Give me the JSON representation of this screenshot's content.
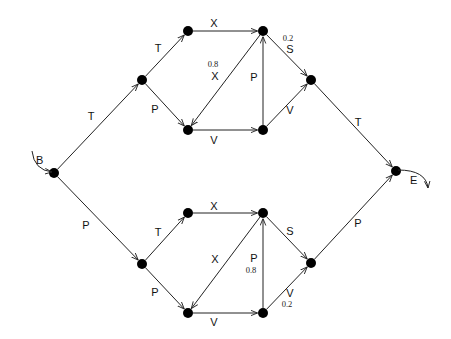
{
  "diagram": {
    "start_label": "B",
    "end_label": "E",
    "colors": {
      "line": "#222222",
      "node": "#000000",
      "background": "#ffffff"
    },
    "nodes": [
      {
        "id": "B",
        "x": 54,
        "y": 173
      },
      {
        "id": "u1",
        "x": 142,
        "y": 80
      },
      {
        "id": "u2",
        "x": 188,
        "y": 31
      },
      {
        "id": "u3",
        "x": 188,
        "y": 130
      },
      {
        "id": "u4",
        "x": 263,
        "y": 31
      },
      {
        "id": "u5",
        "x": 263,
        "y": 130
      },
      {
        "id": "u6",
        "x": 311,
        "y": 80
      },
      {
        "id": "l1",
        "x": 142,
        "y": 264
      },
      {
        "id": "l2",
        "x": 188,
        "y": 213
      },
      {
        "id": "l3",
        "x": 188,
        "y": 313
      },
      {
        "id": "l4",
        "x": 263,
        "y": 213
      },
      {
        "id": "l5",
        "x": 263,
        "y": 313
      },
      {
        "id": "l6",
        "x": 311,
        "y": 263
      },
      {
        "id": "E",
        "x": 396,
        "y": 171
      }
    ],
    "edges": [
      {
        "from": "B",
        "to": "u1",
        "label": "T",
        "lx": 91,
        "ly": 120
      },
      {
        "from": "B",
        "to": "l1",
        "label": "P",
        "lx": 86,
        "ly": 229
      },
      {
        "from": "u1",
        "to": "u2",
        "label": "T",
        "lx": 158,
        "ly": 52
      },
      {
        "from": "u1",
        "to": "u3",
        "label": "P",
        "lx": 155,
        "ly": 113
      },
      {
        "from": "u2",
        "to": "u4",
        "label": "X",
        "lx": 214,
        "ly": 27
      },
      {
        "from": "u3",
        "to": "u5",
        "label": "V",
        "lx": 214,
        "ly": 144
      },
      {
        "from": "u5",
        "to": "u4",
        "label": "P",
        "lx": 254,
        "ly": 81
      },
      {
        "from": "u4",
        "to": "u3",
        "label": "X",
        "lx": 215,
        "ly": 80,
        "prob": "0.8",
        "px": 213,
        "py": 67
      },
      {
        "from": "u4",
        "to": "u6",
        "label": "S",
        "lx": 290,
        "ly": 53,
        "prob": "0.2",
        "px": 288,
        "py": 41
      },
      {
        "from": "u5",
        "to": "u6",
        "label": "V",
        "lx": 290,
        "ly": 114
      },
      {
        "from": "u6",
        "to": "E",
        "label": "T",
        "lx": 358,
        "ly": 126
      },
      {
        "from": "l1",
        "to": "l2",
        "label": "T",
        "lx": 158,
        "ly": 236
      },
      {
        "from": "l1",
        "to": "l3",
        "label": "P",
        "lx": 155,
        "ly": 296
      },
      {
        "from": "l2",
        "to": "l4",
        "label": "X",
        "lx": 214,
        "ly": 210
      },
      {
        "from": "l3",
        "to": "l5",
        "label": "V",
        "lx": 214,
        "ly": 326
      },
      {
        "from": "l5",
        "to": "l4",
        "label": "P",
        "lx": 254,
        "ly": 262,
        "prob": "0.8",
        "px": 251,
        "py": 273
      },
      {
        "from": "l4",
        "to": "l3",
        "label": "X",
        "lx": 215,
        "ly": 263
      },
      {
        "from": "l4",
        "to": "l6",
        "label": "S",
        "lx": 290,
        "ly": 235
      },
      {
        "from": "l5",
        "to": "l6",
        "label": "V",
        "lx": 290,
        "ly": 297,
        "prob": "0.2",
        "px": 287,
        "py": 307
      },
      {
        "from": "l6",
        "to": "E",
        "label": "P",
        "lx": 358,
        "ly": 227
      }
    ]
  }
}
